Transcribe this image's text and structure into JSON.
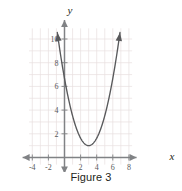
{
  "figure": {
    "caption": "Figure 3",
    "axis_labels": {
      "x": "x",
      "y": "y"
    },
    "colors": {
      "grid": "#e8dfe0",
      "axis": "#808285",
      "curve": "#58595b",
      "tick_text": "#58595b",
      "axis_label_text": "#231f20",
      "caption_text": "#231f20",
      "background": "#ffffff"
    }
  },
  "chart_data": {
    "type": "line",
    "title": "",
    "subtitle": "",
    "xlabel": "x",
    "ylabel": "y",
    "xlim": [
      -5,
      9
    ],
    "ylim": [
      -1.5,
      11.5
    ],
    "xticks": [
      -4,
      -2,
      2,
      4,
      6,
      8
    ],
    "xtick_labels": [
      "-4",
      "-2",
      "2",
      "4",
      "6",
      "8"
    ],
    "yticks": [
      2,
      4,
      6,
      8,
      10
    ],
    "ytick_labels": [
      "2",
      "4",
      "6",
      "8",
      "10"
    ],
    "grid": true,
    "grid_step": 1,
    "legend": null,
    "annotations": [],
    "series": [
      {
        "name": "parabola",
        "shape": "upward parabola",
        "vertex": [
          3,
          1
        ],
        "leading_coefficient": 0.63,
        "equation": "y = 0.63(x - 3)^2 + 1",
        "arrow_start": true,
        "arrow_end": true,
        "x": [
          0.0,
          0.25,
          0.5,
          0.75,
          1.0,
          1.25,
          1.5,
          1.75,
          2.0,
          2.25,
          2.5,
          2.75,
          3.0,
          3.25,
          3.5,
          3.75,
          4.0,
          4.25,
          4.5,
          4.75,
          5.0,
          5.25,
          5.5,
          5.75,
          6.0,
          6.25,
          6.5,
          6.75,
          6.9
        ],
        "y": [
          6.67,
          6.13,
          5.61,
          5.13,
          3.52,
          3.06,
          2.42,
          1.99,
          1.63,
          1.35,
          1.16,
          1.04,
          1.0,
          1.04,
          1.16,
          1.35,
          1.63,
          1.99,
          2.42,
          2.94,
          3.52,
          4.19,
          4.94,
          5.76,
          6.67,
          7.65,
          8.71,
          9.85,
          10.56
        ]
      }
    ],
    "key_points": [
      {
        "label": "vertex",
        "x": 3,
        "y": 1
      },
      {
        "label": "y-intercept (approx)",
        "x": 0,
        "y": 6.7
      }
    ]
  }
}
